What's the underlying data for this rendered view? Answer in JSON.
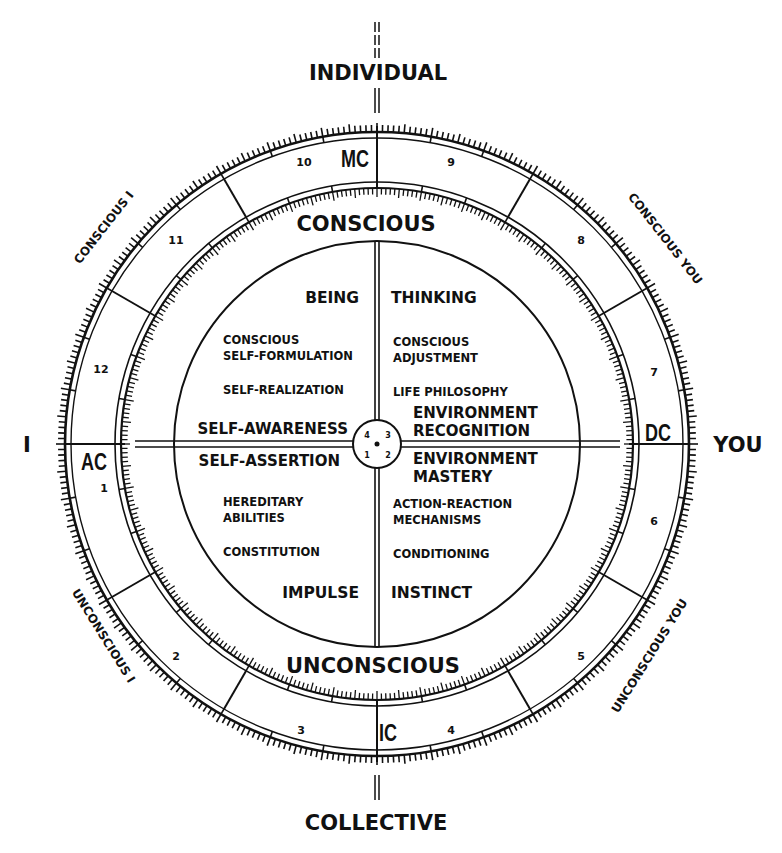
{
  "directions": {
    "top": "INDIVIDUAL",
    "bottom": "COLLECTIVE",
    "left": "I",
    "right": "YOU"
  },
  "angles": {
    "mc": "MC",
    "ic": "IC",
    "ac": "AC",
    "dc": "DC"
  },
  "hemispheres": {
    "upper": "CONSCIOUS",
    "lower": "UNCONSCIOUS"
  },
  "arc_labels": {
    "upper_left": "CONSCIOUS I",
    "upper_right": "CONSCIOUS YOU",
    "lower_left": "UNCONSCIOUS I",
    "lower_right": "UNCONSCIOUS YOU"
  },
  "houses": [
    "1",
    "2",
    "3",
    "4",
    "5",
    "6",
    "7",
    "8",
    "9",
    "10",
    "11",
    "12"
  ],
  "center_numbers": [
    "4",
    "3",
    "1",
    "2"
  ],
  "quadrants": {
    "upper_left": {
      "title": "BEING",
      "item1_line1": "CONSCIOUS",
      "item1_line2": "SELF-FORMULATION",
      "item2": "SELF-REALIZATION",
      "axis_label": "SELF-AWARENESS"
    },
    "upper_right": {
      "title": "THINKING",
      "item1_line1": "CONSCIOUS",
      "item1_line2": "ADJUSTMENT",
      "item2": "LIFE PHILOSOPHY",
      "axis_label_line1": "ENVIRONMENT",
      "axis_label_line2": "RECOGNITION"
    },
    "lower_left": {
      "title": "IMPULSE",
      "item1_line1": "HEREDITARY",
      "item1_line2": "ABILITIES",
      "item2": "CONSTITUTION",
      "axis_label": "SELF-ASSERTION"
    },
    "lower_right": {
      "title": "INSTINCT",
      "item1_line1": "ACTION-REACTION",
      "item1_line2": "MECHANISMS",
      "item2": "CONDITIONING",
      "axis_label_line1": "ENVIRONMENT",
      "axis_label_line2": "MASTERY"
    }
  },
  "colors": {
    "ink": "#111111",
    "paper": "#ffffff"
  }
}
